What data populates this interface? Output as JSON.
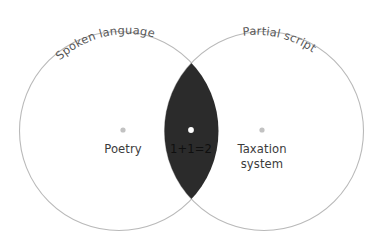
{
  "figure": {
    "type": "venn-diagram",
    "width": 382,
    "height": 247,
    "background_color": "#ffffff"
  },
  "colors": {
    "circle_stroke": "#b9b9b9",
    "circle_fill": "#ffffff",
    "intersection_fill": "#2b2b2b",
    "outer_label_text": "#575757",
    "inner_label_text": "#3b3b3b",
    "intersection_label_text": "#0f0f0f",
    "outer_dot": "#c2c2c2",
    "intersection_dot": "#ffffff"
  },
  "sets": [
    {
      "id": "spoken-language",
      "title": "Spoken language",
      "title_placement": "arc-top-left",
      "center_x": 119,
      "center_y": 131,
      "radius": 99.5,
      "member": {
        "label": "Poetry",
        "lines": [
          "Poetry"
        ],
        "dot_x": 123,
        "dot_y": 130,
        "label_x": 123,
        "label_y": 153
      }
    },
    {
      "id": "partial-script",
      "title": "Partial script",
      "title_placement": "arc-top-right",
      "center_x": 264,
      "center_y": 131,
      "radius": 99.5,
      "member": {
        "label": "Taxation system",
        "lines": [
          "Taxation",
          "system"
        ],
        "dot_x": 262,
        "dot_y": 130,
        "label_x": 262,
        "label_y": 153
      }
    }
  ],
  "intersection": {
    "id": "spoken-language-and-partial-script",
    "label": "1+1=2",
    "lines": [
      "1+1=2"
    ],
    "dot_x": 191,
    "dot_y": 130,
    "label_x": 191,
    "label_y": 153,
    "top_vertex_y": 56,
    "bottom_vertex_y": 207,
    "left_x": 155,
    "right_x": 228
  }
}
